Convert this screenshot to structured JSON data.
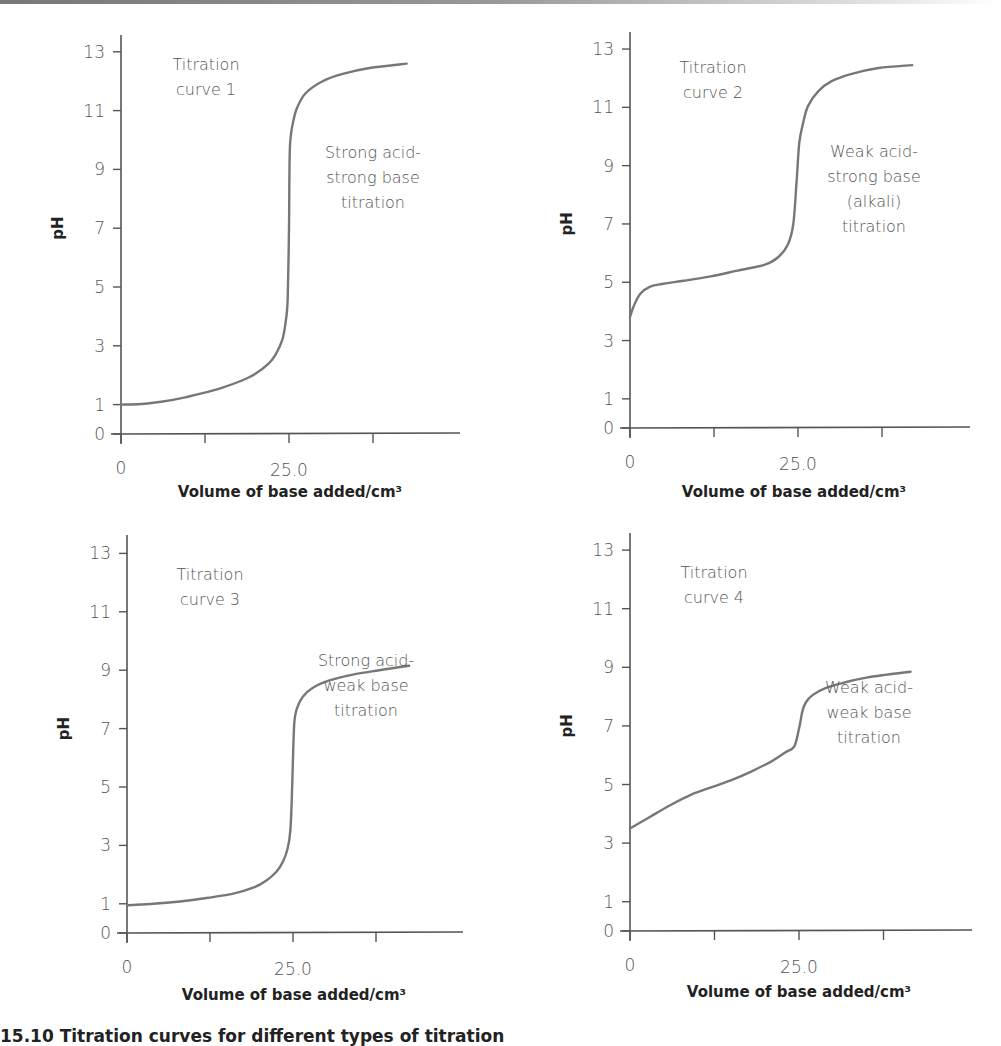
{
  "caption": "15.10 Titration curves for different types of titration",
  "colors": {
    "axis": "#555555",
    "curve": "#777777",
    "text": "#555555",
    "title": "#222222"
  },
  "chart_data": [
    {
      "type": "line",
      "title": "Titration curve 1",
      "annotation": [
        "Strong acid-",
        "strong base",
        "titration"
      ],
      "xlabel": "Volume of base added/cm³",
      "ylabel": "pH",
      "xticks": [
        0,
        12.5,
        25.0,
        37.5
      ],
      "xtick_labels": [
        "0",
        "",
        "25.0",
        ""
      ],
      "yticks": [
        0,
        1,
        3,
        5,
        7,
        9,
        11,
        13
      ],
      "xlim": [
        0,
        50
      ],
      "ylim": [
        0,
        13.6
      ],
      "grid": false,
      "x": [
        0,
        3,
        6,
        9,
        12,
        15,
        18,
        20,
        22,
        23,
        24,
        24.5,
        24.8,
        25,
        25.1,
        25.3,
        25.6,
        26.2,
        27.5,
        30,
        33,
        37,
        42.5
      ],
      "y": [
        1.0,
        1.02,
        1.1,
        1.22,
        1.38,
        1.57,
        1.82,
        2.05,
        2.4,
        2.7,
        3.2,
        3.8,
        4.6,
        7.0,
        9.5,
        10.2,
        10.6,
        11.1,
        11.6,
        12.0,
        12.25,
        12.45,
        12.6
      ],
      "offset": {
        "ox": 121,
        "oy": 434,
        "sx": 6.72,
        "sy": 29.4,
        "axis_top": 35,
        "axis_right": 460
      },
      "text_pos": {
        "title": [
          206,
          70
        ],
        "annot": [
          373,
          158
        ],
        "xlabel": [
          290,
          497
        ]
      }
    },
    {
      "type": "line",
      "title": "Titration curve 2",
      "annotation": [
        "Weak acid-",
        "strong base",
        "(alkali)",
        "titration"
      ],
      "xlabel": "Volume of base added/cm³",
      "ylabel": "pH",
      "xticks": [
        0,
        12.5,
        25.0,
        37.5
      ],
      "xtick_labels": [
        "0",
        "",
        "25.0",
        ""
      ],
      "yticks": [
        0,
        1,
        3,
        5,
        7,
        9,
        11,
        13
      ],
      "xlim": [
        0,
        50
      ],
      "ylim": [
        0,
        13.6
      ],
      "grid": false,
      "x": [
        0,
        0.5,
        1.5,
        3,
        5,
        8,
        12,
        16,
        20,
        22,
        23.5,
        24.3,
        24.8,
        25.2,
        25.8,
        26.5,
        28,
        30,
        33,
        37,
        42
      ],
      "y": [
        3.8,
        4.15,
        4.6,
        4.85,
        4.95,
        5.05,
        5.2,
        5.4,
        5.6,
        5.85,
        6.3,
        7.0,
        8.5,
        9.8,
        10.5,
        11.05,
        11.55,
        11.9,
        12.15,
        12.35,
        12.45
      ],
      "offset": {
        "ox": 630,
        "oy": 428,
        "sx": 6.72,
        "sy": 29.15,
        "axis_top": 32,
        "axis_right": 970
      },
      "text_pos": {
        "title": [
          713,
          73
        ],
        "annot": [
          874,
          157
        ],
        "xlabel": [
          794,
          497
        ]
      }
    },
    {
      "type": "line",
      "title": "Titration curve 3",
      "annotation": [
        "Strong acid-",
        "weak base",
        "titration"
      ],
      "xlabel": "Volume of base added/cm³",
      "ylabel": "pH",
      "xticks": [
        0,
        12.5,
        25.0,
        37.5
      ],
      "xtick_labels": [
        "0",
        "",
        "25.0",
        ""
      ],
      "yticks": [
        0,
        1,
        3,
        5,
        7,
        9,
        11,
        13
      ],
      "xlim": [
        0,
        50
      ],
      "ylim": [
        0,
        13.6
      ],
      "grid": false,
      "x": [
        0,
        4,
        8,
        12,
        16,
        19,
        21,
        22.5,
        23.5,
        24.2,
        24.6,
        24.8,
        25,
        25.2,
        25.6,
        26.5,
        28,
        30.5,
        34,
        38,
        42.5
      ],
      "y": [
        0.95,
        1.0,
        1.08,
        1.2,
        1.35,
        1.55,
        1.8,
        2.1,
        2.45,
        2.9,
        3.5,
        4.5,
        6.0,
        7.2,
        7.7,
        8.1,
        8.4,
        8.65,
        8.85,
        9.0,
        9.15
      ],
      "offset": {
        "ox": 127,
        "oy": 933,
        "sx": 6.64,
        "sy": 29.2,
        "axis_top": 535,
        "axis_right": 463
      },
      "text_pos": {
        "title": [
          210,
          580
        ],
        "annot": [
          366,
          666
        ],
        "xlabel": [
          294,
          1000
        ]
      }
    },
    {
      "type": "line",
      "title": "Titration curve 4",
      "annotation": [
        "Weak acid-",
        "weak base",
        "titration"
      ],
      "xlabel": "Volume of base added/cm³",
      "ylabel": "pH",
      "xticks": [
        0,
        12.5,
        25.0,
        37.5
      ],
      "xtick_labels": [
        "0",
        "",
        "25.0",
        ""
      ],
      "yticks": [
        0,
        1,
        3,
        5,
        7,
        9,
        11,
        13
      ],
      "xlim": [
        0,
        50
      ],
      "ylim": [
        0,
        13.6
      ],
      "grid": false,
      "x": [
        0,
        3,
        6,
        9,
        12,
        15,
        18,
        21,
        23,
        24.3,
        25,
        25.5,
        26,
        27,
        29,
        32,
        35,
        38,
        41.5
      ],
      "y": [
        3.5,
        3.9,
        4.3,
        4.65,
        4.9,
        5.15,
        5.45,
        5.8,
        6.1,
        6.3,
        6.9,
        7.5,
        7.8,
        8.05,
        8.3,
        8.5,
        8.65,
        8.75,
        8.85
      ],
      "offset": {
        "ox": 630,
        "oy": 931,
        "sx": 6.76,
        "sy": 29.3,
        "axis_top": 533,
        "axis_right": 972
      },
      "text_pos": {
        "title": [
          714,
          578
        ],
        "annot": [
          869,
          693
        ],
        "xlabel": [
          799,
          997
        ]
      }
    }
  ]
}
